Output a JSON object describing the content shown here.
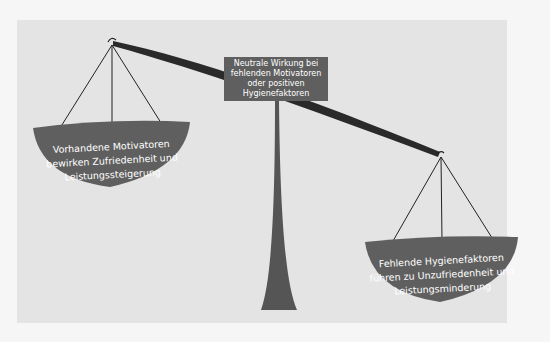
{
  "diagram": {
    "center_label": {
      "lines": [
        "Neutrale Wirkung bei",
        "fehlenden Motivatoren",
        "oder positiven",
        "Hygienefaktoren"
      ]
    },
    "left_pan": {
      "lines": [
        "Vorhandene Motivatoren",
        "bewirken Zufriedenheit und",
        "Leistungssteigerung"
      ]
    },
    "right_pan": {
      "lines": [
        "Fehlende Hygienefaktoren",
        "führen zu Unzufriedenheit und",
        "Leistungsminderung"
      ]
    },
    "colors": {
      "panel_bg": "#e4e4e4",
      "shape_fill": "#5f5f5f",
      "beam": "#2a2a2a",
      "text": "#ffffff"
    }
  }
}
